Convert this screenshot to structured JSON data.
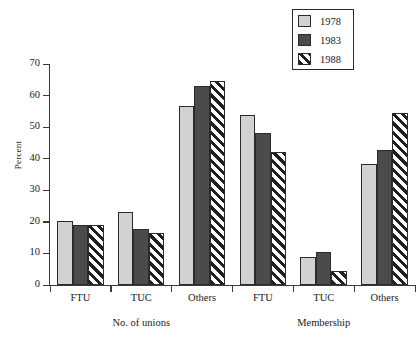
{
  "chart_data": {
    "type": "bar",
    "title": "",
    "xlabel": "",
    "ylabel": "Percent",
    "ylim": [
      0,
      70
    ],
    "yticks": [
      0,
      10,
      20,
      30,
      40,
      50,
      60,
      70
    ],
    "grid": false,
    "legend_position": "top-right",
    "categories": [
      "FTU",
      "TUC",
      "Others",
      "FTU",
      "TUC",
      "Others"
    ],
    "group_labels": [
      "No. of unions",
      "Membership"
    ],
    "series": [
      {
        "name": "1978",
        "color": "#d2d2d2",
        "pattern": "solid-light-gray",
        "values": [
          20.4,
          23.2,
          56.6,
          53.8,
          8.8,
          38.3
        ]
      },
      {
        "name": "1983",
        "color": "#4b4b4b",
        "pattern": "solid-dark-gray",
        "values": [
          19.0,
          17.9,
          63.0,
          48.1,
          10.5,
          42.8
        ]
      },
      {
        "name": "1988",
        "color": "#ffffff",
        "pattern": "diagonal-hatch",
        "values": [
          19.0,
          16.6,
          64.5,
          42.0,
          4.5,
          54.5
        ]
      }
    ]
  },
  "axis": {
    "y_label": "Percent",
    "y_ticks": [
      "0",
      "10",
      "20",
      "30",
      "40",
      "50",
      "60",
      "70"
    ]
  },
  "legend": {
    "items": [
      {
        "label": "1978"
      },
      {
        "label": "1983"
      },
      {
        "label": "1988"
      }
    ]
  },
  "x_axis": {
    "categories": [
      {
        "label": "FTU"
      },
      {
        "label": "TUC"
      },
      {
        "label": "Others"
      },
      {
        "label": "FTU"
      },
      {
        "label": "TUC"
      },
      {
        "label": "Others"
      }
    ],
    "groups": [
      {
        "label": "No. of unions"
      },
      {
        "label": "Membership"
      }
    ]
  }
}
